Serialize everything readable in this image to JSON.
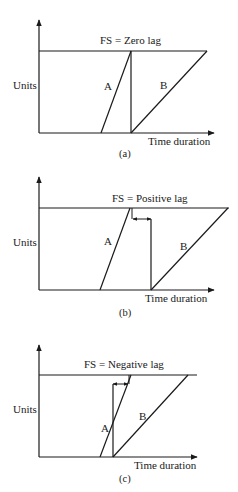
{
  "colors": {
    "ink": "#1a1a1a",
    "background": "#ffffff"
  },
  "diagrams": [
    {
      "id": "a",
      "title": "FS = Zero lag",
      "y_label": "Units",
      "x_label": "Time duration",
      "caption": "(a)",
      "activity_a": "A",
      "activity_b": "B"
    },
    {
      "id": "b",
      "title": "FS = Positive lag",
      "y_label": "Units",
      "x_label": "Time duration",
      "caption": "(b)",
      "activity_a": "A",
      "activity_b": "B"
    },
    {
      "id": "c",
      "title": "FS = Negative lag",
      "y_label": "Units",
      "x_label": "Time duration",
      "caption": "(c)",
      "activity_a": "A",
      "activity_b": "B"
    }
  ]
}
